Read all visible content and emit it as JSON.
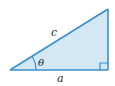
{
  "diagram": {
    "type": "right-triangle",
    "colors": {
      "stroke": "#3a8fcf",
      "fill": "#d3e7f4",
      "text": "#2a2a2a"
    },
    "labels": {
      "hypotenuse": "c",
      "adjacent": "a",
      "angle": "θ"
    },
    "right_angle_marker": true
  }
}
